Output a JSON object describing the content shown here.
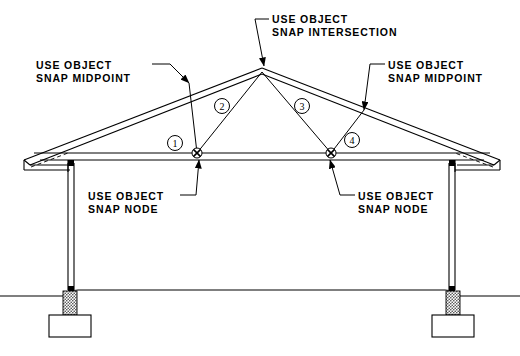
{
  "drawing": {
    "title": "Roof truss section with object snap annotations",
    "ink_color": "#000000",
    "background_color": "#ffffff",
    "hatch_color": "#3a3a3a"
  },
  "annotations": [
    {
      "id": "snap-midpoint-left",
      "line1": "USE OBJECT",
      "line2": "SNAP MIDPOINT",
      "text_x": 36,
      "text_y": 59,
      "leader": "M 152 64 L 170 64 L 189 83",
      "arrow_at": [
        189,
        83
      ],
      "arrow_angle": 45
    },
    {
      "id": "snap-intersection-apex",
      "line1": "USE OBJECT",
      "line2": "SNAP INTERSECTION",
      "text_x": 272,
      "text_y": 13,
      "leader": "M 269 19 L 255 19 L 264 66",
      "arrow_at": [
        264,
        66
      ],
      "arrow_angle": 79
    },
    {
      "id": "snap-midpoint-right",
      "line1": "USE OBJECT",
      "line2": "SNAP MIDPOINT",
      "text_x": 388,
      "text_y": 59,
      "leader": "M 385 64 L 370 64 L 364 110",
      "arrow_at": [
        364,
        110
      ],
      "arrow_angle": 98
    },
    {
      "id": "snap-node-left",
      "line1": "USE OBJECT",
      "line2": "SNAP NODE",
      "text_x": 88,
      "text_y": 190,
      "leader": "M 180 195 L 196 195 L 199 160",
      "arrow_at": [
        199,
        160
      ],
      "arrow_angle": -84
    },
    {
      "id": "snap-node-right",
      "line1": "USE OBJECT",
      "line2": "SNAP NODE",
      "text_x": 358,
      "text_y": 190,
      "leader": "M 355 195 L 340 195 L 330 160",
      "arrow_at": [
        330,
        160
      ],
      "arrow_angle": -106
    }
  ],
  "member_tags": [
    {
      "label": "1",
      "cx": 175,
      "cy": 143,
      "r": 7.5
    },
    {
      "label": "2",
      "cx": 222,
      "cy": 106,
      "r": 7.5
    },
    {
      "label": "3",
      "cx": 302,
      "cy": 106,
      "r": 7.5
    },
    {
      "label": "4",
      "cx": 352,
      "cy": 140,
      "r": 7.5
    }
  ],
  "snap_nodes": [
    {
      "id": "node-left",
      "cx": 197,
      "cy": 153,
      "r": 5
    },
    {
      "id": "node-right",
      "cx": 331,
      "cy": 153,
      "r": 5
    }
  ],
  "geometry": {
    "apex": [
      262,
      68
    ],
    "left_eave": [
      33,
      157
    ],
    "right_eave": [
      492,
      157
    ],
    "bottom_chord_y": 153,
    "ceiling_y": 160,
    "wall_left_x": 68,
    "wall_right_x": 455,
    "wall_bottom_y": 290,
    "slab_y": 296,
    "footing_left": {
      "x": 50,
      "y": 315,
      "w": 42,
      "h": 22
    },
    "footing_right": {
      "x": 440,
      "y": 315,
      "w": 42,
      "h": 22
    },
    "pier_left": {
      "x": 63,
      "y": 291,
      "w": 14,
      "h": 24
    },
    "pier_right": {
      "x": 453,
      "y": 291,
      "w": 14,
      "h": 24
    }
  }
}
